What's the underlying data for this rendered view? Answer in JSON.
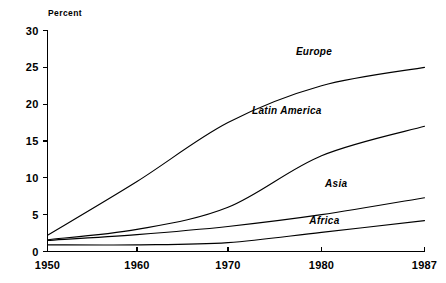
{
  "chart_data": {
    "type": "line",
    "title": "",
    "subtitle": "",
    "xlabel": "",
    "ylabel": "Percent",
    "ylim": [
      0,
      30
    ],
    "xlim": [
      1950,
      1987
    ],
    "yticks": [
      0,
      5,
      10,
      15,
      20,
      25,
      30
    ],
    "ytick_labels": [
      "0",
      "5",
      "10",
      "15",
      "20",
      "25",
      "30"
    ],
    "xticks": [
      1950,
      1960,
      1970,
      1980,
      1987
    ],
    "xtick_labels": [
      "1950",
      "1960",
      "1970",
      "1980",
      "1987"
    ],
    "x": [
      1950,
      1960,
      1970,
      1980,
      1987
    ],
    "grid": false,
    "legend_position": "inline-right-of-line-ends",
    "line_color": "#000000",
    "background_color": "#ffffff",
    "series": [
      {
        "name": "Europe",
        "values": [
          2.2,
          9.5,
          17.5,
          22.5,
          25.0
        ],
        "label_x": 1979.2,
        "label_y": 27.2
      },
      {
        "name": "Latin America",
        "values": [
          1.6,
          3.0,
          6.0,
          13.0,
          17.0
        ],
        "label_x": 1976.3,
        "label_y": 19.2
      },
      {
        "name": "Asia",
        "values": [
          1.5,
          2.3,
          3.4,
          5.0,
          7.3
        ],
        "label_x": 1981.0,
        "label_y": 9.3
      },
      {
        "name": "Africa",
        "values": [
          0.9,
          0.9,
          1.2,
          2.6,
          4.2
        ],
        "label_x": 1980.2,
        "label_y": 4.3
      }
    ]
  },
  "axis": {
    "y_title": "Percent"
  }
}
